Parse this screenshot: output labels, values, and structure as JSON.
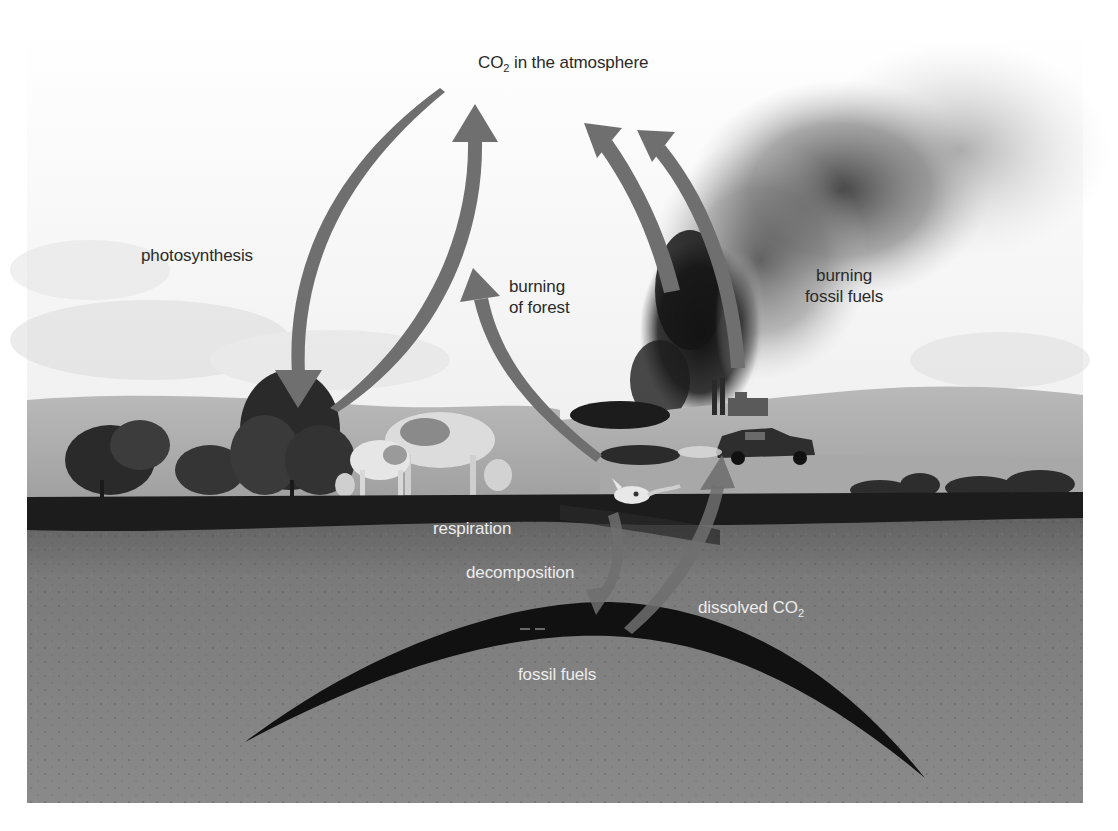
{
  "figure": {
    "colors": {
      "background": "#ffffff",
      "sky": "#e9e9e9",
      "smoke": "#1c1c1c",
      "arrow": "#6f6f6f",
      "ground_surface": "#1e1e1e",
      "soil": "#7d7d7d",
      "fossil_fuel_deposit": "#111111",
      "dark_text": "#2a2a2a",
      "light_text": "#ececec"
    }
  },
  "labels": {
    "atmosphere": {
      "prefix": "CO",
      "sub": "2",
      "suffix": " in the atmosphere"
    },
    "photosynthesis": "photosynthesis",
    "burning_forest": {
      "line1": "burning",
      "line2": "of forest"
    },
    "burning_fossil_fuels": {
      "line1": "burning",
      "line2": "fossil fuels"
    },
    "respiration": "respiration",
    "decomposition": "decomposition",
    "dissolved_co2": {
      "prefix": "dissolved CO",
      "sub": "2"
    },
    "fossil_fuels": "fossil fuels"
  },
  "scene_elements": [
    {
      "name": "trees",
      "position": "left"
    },
    {
      "name": "grazing cows",
      "position": "center-left"
    },
    {
      "name": "animal skull",
      "position": "center"
    },
    {
      "name": "factory with smokestacks",
      "position": "center-right"
    },
    {
      "name": "car with exhaust",
      "position": "center-right"
    },
    {
      "name": "forest fire smoke",
      "position": "upper right"
    }
  ],
  "arrows": [
    {
      "from": "atmosphere",
      "to": "trees",
      "label": "photosynthesis"
    },
    {
      "from": "trees",
      "to": "atmosphere",
      "label": "respiration"
    },
    {
      "from": "burning forest",
      "to": "atmosphere",
      "label": "burning of forest"
    },
    {
      "from": "factory",
      "to": "atmosphere",
      "label": "burning fossil fuels"
    },
    {
      "from": "car",
      "to": "atmosphere",
      "label": "burning fossil fuels"
    },
    {
      "from": "dead animal",
      "to": "fossil fuels",
      "label": "decomposition"
    },
    {
      "from": "fossil fuels",
      "to": "surface",
      "label": "dissolved CO2"
    }
  ]
}
